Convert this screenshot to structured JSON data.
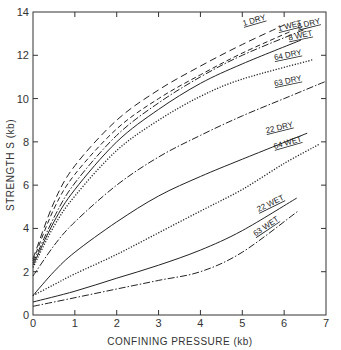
{
  "chart_data": {
    "type": "line",
    "title": "",
    "xlabel": "CONFINING PRESSURE (kb)",
    "ylabel": "STRENGTH  S  (kb)",
    "xlim": [
      0,
      7
    ],
    "ylim": [
      0,
      14
    ],
    "xticks": [
      0,
      1,
      2,
      3,
      4,
      5,
      6,
      7
    ],
    "yticks": [
      0,
      2,
      4,
      6,
      8,
      10,
      12,
      14
    ],
    "xtick_labels": [
      "0",
      "1",
      "2",
      "3",
      "4",
      "5",
      "6",
      "7"
    ],
    "ytick_labels": [
      "0",
      "2",
      "4",
      "6",
      "8",
      "10",
      "12",
      "14"
    ],
    "grid": false,
    "legend": "inline labels at curve ends",
    "series": [
      {
        "name": "1 DRY",
        "style": "long-dash",
        "x": [
          0,
          0.5,
          1,
          2,
          3,
          4,
          5,
          6.0
        ],
        "values": [
          2.6,
          5.2,
          6.9,
          9.0,
          10.4,
          11.5,
          12.5,
          13.4
        ]
      },
      {
        "name": "1 WET",
        "style": "dash",
        "x": [
          0,
          0.5,
          1,
          2,
          3,
          4,
          5,
          6.15
        ],
        "values": [
          2.5,
          4.9,
          6.5,
          8.6,
          10.0,
          11.1,
          12.1,
          13.1
        ]
      },
      {
        "name": "8 DRY",
        "style": "dash-dot",
        "x": [
          0,
          0.5,
          1,
          2,
          3,
          4,
          5,
          6.5
        ],
        "values": [
          2.4,
          4.5,
          6.1,
          8.3,
          9.8,
          11.0,
          12.0,
          13.2
        ]
      },
      {
        "name": "8 WET",
        "style": "solid",
        "x": [
          0,
          0.5,
          1,
          2,
          3,
          4,
          5,
          6.4
        ],
        "values": [
          2.3,
          4.3,
          5.8,
          8.0,
          9.5,
          10.7,
          11.6,
          12.7
        ]
      },
      {
        "name": "64 DRY",
        "style": "dotted",
        "x": [
          0,
          0.5,
          1,
          2,
          3,
          4,
          5,
          6.7
        ],
        "values": [
          2.2,
          4.1,
          5.5,
          7.6,
          9.0,
          10.1,
          10.9,
          11.8
        ]
      },
      {
        "name": "63 DRY",
        "style": "dash-dot",
        "x": [
          0,
          0.5,
          1,
          2,
          3,
          4,
          5,
          6,
          7
        ],
        "values": [
          1.8,
          3.2,
          4.3,
          6.0,
          7.3,
          8.3,
          9.2,
          10.0,
          10.8
        ]
      },
      {
        "name": "22 DRY",
        "style": "solid",
        "x": [
          0,
          0.5,
          1,
          2,
          3,
          4,
          5,
          6.55
        ],
        "values": [
          0.9,
          2.0,
          2.9,
          4.3,
          5.5,
          6.4,
          7.2,
          8.4
        ]
      },
      {
        "name": "64 WET",
        "style": "dotted",
        "x": [
          0,
          0.5,
          1,
          2,
          3,
          4,
          5,
          6,
          6.85
        ],
        "values": [
          0.9,
          1.4,
          1.9,
          2.8,
          3.8,
          4.8,
          5.8,
          7.0,
          7.9
        ]
      },
      {
        "name": "22 WET",
        "style": "solid",
        "x": [
          0,
          1,
          2,
          3,
          4,
          5,
          6.3
        ],
        "values": [
          0.6,
          1.1,
          1.7,
          2.3,
          3.0,
          3.9,
          5.4
        ]
      },
      {
        "name": "63 WET",
        "style": "dash-dot",
        "x": [
          0,
          1,
          2,
          3,
          4,
          5,
          6.33
        ],
        "values": [
          0.4,
          0.8,
          1.2,
          1.6,
          2.0,
          2.9,
          4.8
        ]
      }
    ],
    "annotations": [
      {
        "text": "1 DRY",
        "x": 5.3,
        "y": 13.5,
        "angle": -16
      },
      {
        "text": "1 WET",
        "x": 6.15,
        "y": 13.25,
        "angle": -14
      },
      {
        "text": "8 DRY",
        "x": 6.6,
        "y": 13.35,
        "angle": -14
      },
      {
        "text": "8 WET",
        "x": 6.4,
        "y": 12.8,
        "angle": -12
      },
      {
        "text": "64 DRY",
        "x": 6.1,
        "y": 11.9,
        "angle": -12
      },
      {
        "text": "63 DRY",
        "x": 6.1,
        "y": 10.7,
        "angle": -12
      },
      {
        "text": "22 DRY",
        "x": 5.9,
        "y": 8.55,
        "angle": -14
      },
      {
        "text": "64 WET",
        "x": 6.1,
        "y": 7.85,
        "angle": -16
      },
      {
        "text": "22 WET",
        "x": 5.7,
        "y": 5.05,
        "angle": -26
      },
      {
        "text": "63 WET",
        "x": 5.6,
        "y": 4.0,
        "angle": -34
      }
    ]
  }
}
